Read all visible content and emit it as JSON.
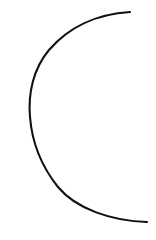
{
  "canvas": {
    "width": 156,
    "height": 240,
    "background_color": "#ffffff",
    "title": "Arc Drawing"
  },
  "drawing": {
    "name": "open-arc",
    "description": "Single open arc forming a left-opening crescent / C-shape",
    "stroke_color": "#111111",
    "stroke_width": 2.1,
    "fill": "none",
    "line_cap": "round",
    "shapes": [
      {
        "name": "c-arc",
        "type": "path",
        "d": "M 130 12 C 96 14 68 28 49 50 C 33 69 28 94 30 117 C 32 142 42 167 58 187 C 76 209 112 221 147 222",
        "start_point": [
          130,
          12
        ],
        "end_point": [
          147,
          222
        ],
        "leftmost_point": [
          30,
          117
        ],
        "opening_direction": "right"
      }
    ]
  }
}
